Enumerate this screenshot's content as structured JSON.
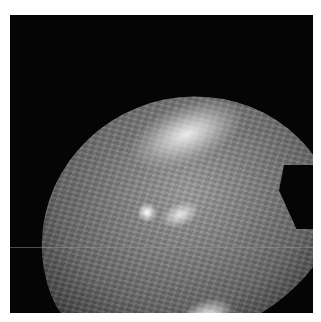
{
  "image": {
    "description": "Grayscale microscopic/endoscopic field view of textured tissue in a circular aperture on black background",
    "colors": {
      "background": "#ffffff",
      "frame": "#050505",
      "tissue_mid": "#6a6a6a",
      "highlight": "#e6e6e6"
    }
  }
}
